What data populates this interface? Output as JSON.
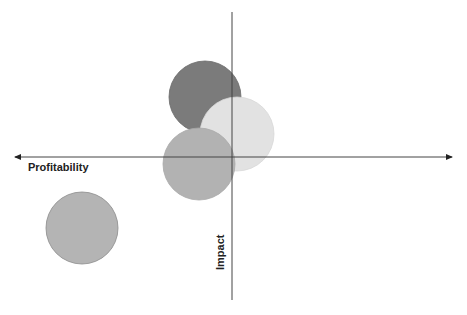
{
  "diagram": {
    "type": "quadrant-bubble",
    "axes": {
      "x_label": "Profitability",
      "y_label": "Impact",
      "color": "#333333"
    },
    "bubbles": [
      {
        "id": "bubble-dark",
        "cx": 205,
        "cy": 97,
        "r": 36,
        "color": "#7b7b7b",
        "stroke": "#6a6a6a"
      },
      {
        "id": "bubble-light",
        "cx": 237,
        "cy": 134,
        "r": 37,
        "color": "#e2e2e2",
        "stroke": "#d8d8d8"
      },
      {
        "id": "bubble-mid",
        "cx": 199,
        "cy": 164,
        "r": 36,
        "color": "#b2b2b2",
        "stroke": "#a8a8a8"
      },
      {
        "id": "bubble-bottom-left",
        "cx": 82,
        "cy": 228,
        "r": 36,
        "color": "#b4b4b4",
        "stroke": "#8a8a8a"
      }
    ]
  }
}
